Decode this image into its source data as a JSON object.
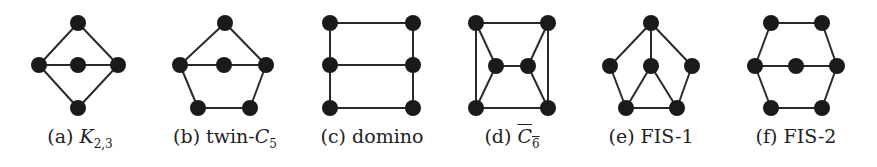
{
  "figures": [
    {
      "id": "a",
      "label": "(a)",
      "name": "K",
      "sub": "2,3",
      "sup": "",
      "overline": false,
      "cx": 78,
      "nodes": [
        [
          78,
          23
        ],
        [
          39,
          65
        ],
        [
          78,
          65
        ],
        [
          118,
          65
        ],
        [
          78,
          108
        ]
      ],
      "edges": [
        [
          0,
          1
        ],
        [
          0,
          3
        ],
        [
          1,
          2
        ],
        [
          2,
          3
        ],
        [
          1,
          4
        ],
        [
          3,
          4
        ]
      ]
    },
    {
      "id": "b",
      "label": "(b)",
      "name": "twin-C",
      "sub": "5",
      "overline": false,
      "cx": 225,
      "nodes": [
        [
          225,
          23
        ],
        [
          180,
          65
        ],
        [
          224,
          65
        ],
        [
          266,
          65
        ],
        [
          198,
          108
        ],
        [
          250,
          108
        ]
      ],
      "edges": [
        [
          0,
          1
        ],
        [
          0,
          3
        ],
        [
          1,
          2
        ],
        [
          2,
          3
        ],
        [
          1,
          4
        ],
        [
          4,
          5
        ],
        [
          5,
          3
        ]
      ]
    },
    {
      "id": "c",
      "label": "(c)",
      "name": "domino",
      "sub": "",
      "overline": false,
      "cx": 372,
      "nodes": [
        [
          330,
          23
        ],
        [
          413,
          23
        ],
        [
          330,
          65
        ],
        [
          413,
          65
        ],
        [
          330,
          108
        ],
        [
          413,
          108
        ]
      ],
      "edges": [
        [
          0,
          1
        ],
        [
          2,
          3
        ],
        [
          4,
          5
        ],
        [
          0,
          2
        ],
        [
          2,
          4
        ],
        [
          1,
          3
        ],
        [
          3,
          5
        ]
      ]
    },
    {
      "id": "d",
      "label": "(d)",
      "name": "C",
      "sub": "6",
      "overline": true,
      "cx": 512,
      "nodes": [
        [
          476,
          23
        ],
        [
          548,
          23
        ],
        [
          496,
          66
        ],
        [
          528,
          66
        ],
        [
          476,
          108
        ],
        [
          548,
          108
        ]
      ],
      "edges": [
        [
          0,
          1
        ],
        [
          4,
          5
        ],
        [
          0,
          4
        ],
        [
          1,
          5
        ],
        [
          0,
          2
        ],
        [
          2,
          4
        ],
        [
          1,
          3
        ],
        [
          3,
          5
        ],
        [
          2,
          3
        ]
      ]
    },
    {
      "id": "e",
      "label": "(e)",
      "name": "FIS-1",
      "sub": "",
      "overline": false,
      "cx": 651,
      "nodes": [
        [
          651,
          23
        ],
        [
          610,
          66
        ],
        [
          651,
          66
        ],
        [
          692,
          66
        ],
        [
          626,
          108
        ],
        [
          677,
          108
        ]
      ],
      "edges": [
        [
          0,
          1
        ],
        [
          0,
          2
        ],
        [
          0,
          3
        ],
        [
          1,
          4
        ],
        [
          3,
          5
        ],
        [
          4,
          5
        ],
        [
          2,
          4
        ],
        [
          2,
          5
        ]
      ]
    },
    {
      "id": "f",
      "label": "(f)",
      "name": "FIS-2",
      "sub": "",
      "overline": false,
      "cx": 796,
      "nodes": [
        [
          771,
          23
        ],
        [
          822,
          23
        ],
        [
          755,
          66
        ],
        [
          796,
          66
        ],
        [
          837,
          66
        ],
        [
          771,
          108
        ],
        [
          822,
          108
        ]
      ],
      "edges": [
        [
          0,
          1
        ],
        [
          0,
          2
        ],
        [
          1,
          4
        ],
        [
          2,
          3
        ],
        [
          3,
          4
        ],
        [
          2,
          5
        ],
        [
          4,
          6
        ],
        [
          5,
          6
        ]
      ]
    }
  ],
  "captions": {
    "a": {
      "prefix": "(a) ",
      "main": "K",
      "sub": "2,3"
    },
    "b": {
      "prefix": "(b) twin-",
      "main": "C",
      "sub": "5"
    },
    "c": {
      "prefix": "(c) domino",
      "main": "",
      "sub": ""
    },
    "d": {
      "prefix": "(d) ",
      "main": "C",
      "sub": "6"
    },
    "e": {
      "prefix": "(e) FIS-1",
      "main": "",
      "sub": ""
    },
    "f": {
      "prefix": "(f) FIS-2",
      "main": "",
      "sub": ""
    }
  },
  "style": {
    "node_color": "#1a1a1a",
    "edge_color": "#2a2a2a",
    "node_radius": 8
  }
}
